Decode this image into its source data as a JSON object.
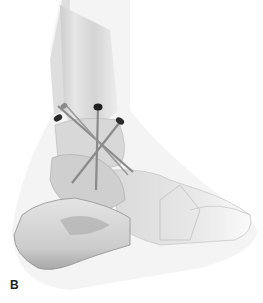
{
  "figure": {
    "panel_label": "B",
    "view": "lateral",
    "screw_count": 3,
    "colors": {
      "background": "#ffffff",
      "bone_light": "#ececec",
      "bone_mid": "#cfcfcf",
      "bone_dark": "#9a9a9a",
      "screw_head": "#2a2a2a",
      "screw_shaft": "#8a8a8a",
      "label": "#1e1e1e"
    }
  }
}
